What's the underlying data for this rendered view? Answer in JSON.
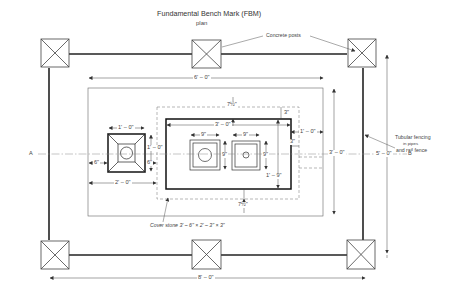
{
  "title": "Fundamental Bench Mark (FBM)",
  "subtitle": "plan",
  "annotations": {
    "concrete_posts": "Concrete posts",
    "tubular_fencing_line1": "Tubular fencing",
    "tubular_fencing_line2": "in pipes",
    "tubular_fencing_line3": "and rail fence",
    "cover_stone": "Cover stone  3' – 6\" × 2' – 3\" × 3\"",
    "section_a": "A",
    "section_b": "B"
  },
  "dimensions": {
    "overall_width": "8' – 0\"",
    "inner_width": "6' – 0\"",
    "inner_height": "5' – 0\"",
    "slab_width": "3' – 0\"",
    "slab_height": "3' – 0\"",
    "block_height": "1' – 9\"",
    "pillar_width": "1' – 0\"",
    "pillar_height": "1' – 0\"",
    "pillar_offset": "6\"",
    "pillar_gap": "6\"",
    "pillar_to_center": "2' – 0\"",
    "offset_top": "7½\"",
    "offset_bottom": "7½\"",
    "offset_right": "1' – 0\"",
    "edge_3_top": "3\"",
    "edge_3_right": "3\"",
    "box1_width": "9\"",
    "box1_height": "9\"",
    "box2_width": "9\"",
    "box2_height": "9\""
  },
  "colors": {
    "line": "#222222",
    "thin": "#555555",
    "dashed": "#888888"
  }
}
